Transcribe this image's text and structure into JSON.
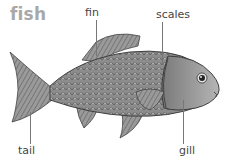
{
  "title": "fish",
  "labels": {
    "fin": "fin",
    "scales": "scales",
    "tail": "tail",
    "gill": "gill"
  },
  "colors": {
    "title": "#a8a8a8",
    "body": "#8a8a8a",
    "label_text": "#444444"
  }
}
